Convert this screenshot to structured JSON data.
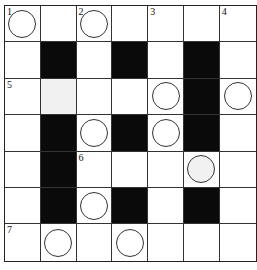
{
  "puzzle": {
    "type": "crossword",
    "rows": 7,
    "cols": 7,
    "colors": {
      "black": "#0a0a0a",
      "white": "#ffffff",
      "gray": "#f1f1f1",
      "line": "#333333"
    },
    "cells": [
      [
        {
          "t": "w",
          "n": "1",
          "c": true
        },
        {
          "t": "w"
        },
        {
          "t": "w",
          "n": "2",
          "c": true
        },
        {
          "t": "w"
        },
        {
          "t": "w",
          "n": "3"
        },
        {
          "t": "w"
        },
        {
          "t": "w",
          "n": "4"
        }
      ],
      [
        {
          "t": "w"
        },
        {
          "t": "b"
        },
        {
          "t": "w"
        },
        {
          "t": "b"
        },
        {
          "t": "w"
        },
        {
          "t": "b"
        },
        {
          "t": "w"
        }
      ],
      [
        {
          "t": "w",
          "n": "5"
        },
        {
          "t": "g"
        },
        {
          "t": "w"
        },
        {
          "t": "w"
        },
        {
          "t": "w",
          "c": true
        },
        {
          "t": "b"
        },
        {
          "t": "w",
          "c": true
        }
      ],
      [
        {
          "t": "w"
        },
        {
          "t": "b"
        },
        {
          "t": "w",
          "c": true
        },
        {
          "t": "b"
        },
        {
          "t": "w",
          "c": true
        },
        {
          "t": "b"
        },
        {
          "t": "w"
        }
      ],
      [
        {
          "t": "w"
        },
        {
          "t": "b"
        },
        {
          "t": "w",
          "n": "6"
        },
        {
          "t": "w"
        },
        {
          "t": "w"
        },
        {
          "t": "g",
          "c": true
        },
        {
          "t": "w"
        }
      ],
      [
        {
          "t": "w"
        },
        {
          "t": "b"
        },
        {
          "t": "w",
          "c": true
        },
        {
          "t": "b"
        },
        {
          "t": "w"
        },
        {
          "t": "b"
        },
        {
          "t": "w"
        }
      ],
      [
        {
          "t": "w",
          "n": "7"
        },
        {
          "t": "w",
          "c": true
        },
        {
          "t": "w"
        },
        {
          "t": "w",
          "c": true
        },
        {
          "t": "w"
        },
        {
          "t": "w"
        },
        {
          "t": "w"
        }
      ]
    ],
    "clue_numbers": [
      "1",
      "2",
      "3",
      "4",
      "5",
      "6",
      "7"
    ]
  }
}
